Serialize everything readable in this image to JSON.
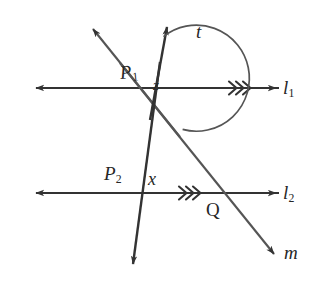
{
  "figure": {
    "kind": "euclidean-geometry-diagram",
    "background_color": "#ffffff",
    "stroke_color": "#333333",
    "text_color": "#262626"
  },
  "labels": {
    "transversal_t": "t",
    "point_P1_letter": "P",
    "point_P1_sub": "1",
    "angle_at_P1": "z",
    "line_l1_letter": "l",
    "line_l1_sub": "1",
    "point_P2_letter": "P",
    "point_P2_sub": "2",
    "angle_at_P2": "x",
    "line_l2_letter": "l",
    "line_l2_sub": "2",
    "point_Q": "Q",
    "line_m": "m"
  },
  "geometry": {
    "line_l1": {
      "name": "l1",
      "y": 88,
      "x_start": 33,
      "x_end": 279,
      "arrow_left": true,
      "arrow_right": true,
      "parallel_marks": 3,
      "parallel_mark_x": 238
    },
    "line_l2": {
      "name": "l2",
      "y": 193,
      "x_start": 33,
      "x_end": 279,
      "arrow_left": true,
      "arrow_right": true,
      "parallel_marks": 3,
      "parallel_mark_x": 188
    },
    "transversal_t": {
      "name": "t",
      "x_top": 168,
      "y_top": 24,
      "x_bottom": 132,
      "y_bottom": 268,
      "arrow_top": true,
      "arrow_bottom": true
    },
    "transversal_m": {
      "name": "m",
      "x_top": 90,
      "y_top": 25,
      "x_bottom": 277,
      "y_bottom": 257,
      "arrow_top_left": true,
      "arrow_bottom_right": true
    },
    "intersections": [
      {
        "name": "P1",
        "x": 155,
        "y": 88,
        "lines": [
          "t",
          "l1",
          "m"
        ]
      },
      {
        "name": "P2",
        "x": 141,
        "y": 193,
        "lines": [
          "t",
          "l2"
        ]
      },
      {
        "name": "Q",
        "x": 223,
        "y": 193,
        "lines": [
          "m",
          "l2"
        ]
      }
    ],
    "angle_arc": {
      "at": "P1",
      "radius": 52,
      "from_ray": "t",
      "to_ray": "m-down",
      "label": "z"
    }
  }
}
